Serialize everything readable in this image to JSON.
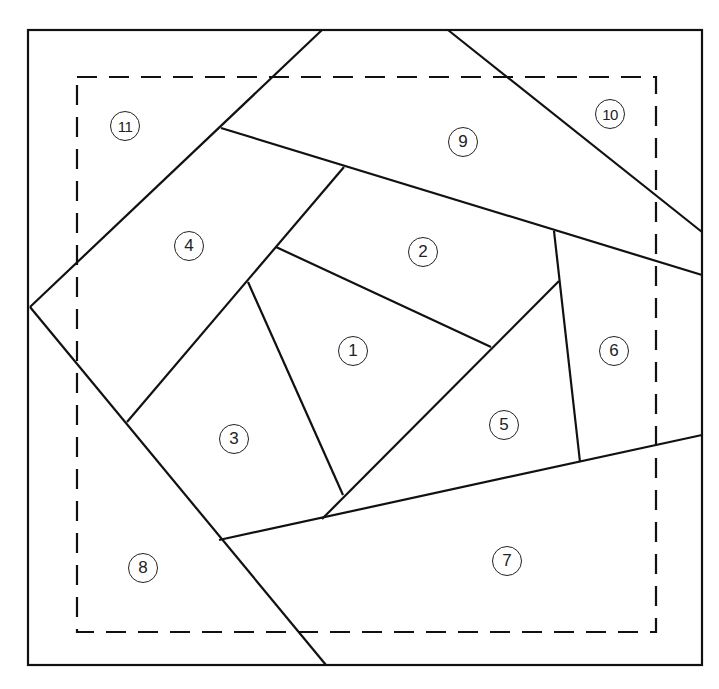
{
  "diagram": {
    "type": "foundation-piecing quilt block pattern",
    "outer_border": {
      "x1": 28,
      "y1": 30,
      "x2": 702,
      "y2": 665
    },
    "seam_allowance_dashed": {
      "x1": 77,
      "y1": 77,
      "x2": 656,
      "y2": 632
    },
    "seam_lines": [
      {
        "id": "A",
        "x1": 322,
        "y1": 30,
        "x2": 30,
        "y2": 307
      },
      {
        "id": "B",
        "x1": 30,
        "y1": 307,
        "x2": 326,
        "y2": 665
      },
      {
        "id": "C",
        "x1": 448,
        "y1": 30,
        "x2": 702,
        "y2": 232
      },
      {
        "id": "D",
        "x1": 221,
        "y1": 128,
        "x2": 702,
        "y2": 275
      },
      {
        "id": "E",
        "x1": 219,
        "y1": 540,
        "x2": 702,
        "y2": 435
      },
      {
        "id": "F",
        "x1": 344,
        "y1": 167,
        "x2": 127,
        "y2": 422
      },
      {
        "id": "G",
        "x1": 276,
        "y1": 247,
        "x2": 491,
        "y2": 347
      },
      {
        "id": "H",
        "x1": 248,
        "y1": 282,
        "x2": 343,
        "y2": 495
      },
      {
        "id": "I",
        "x1": 322,
        "y1": 519,
        "x2": 559,
        "y2": 281
      },
      {
        "id": "J",
        "x1": 554,
        "y1": 231,
        "x2": 580,
        "y2": 462
      }
    ],
    "pieces": [
      {
        "label": "1",
        "x": 353,
        "y": 351
      },
      {
        "label": "2",
        "x": 423,
        "y": 252
      },
      {
        "label": "3",
        "x": 234,
        "y": 439
      },
      {
        "label": "4",
        "x": 189,
        "y": 246
      },
      {
        "label": "5",
        "x": 504,
        "y": 425
      },
      {
        "label": "6",
        "x": 614,
        "y": 351
      },
      {
        "label": "7",
        "x": 507,
        "y": 561
      },
      {
        "label": "8",
        "x": 143,
        "y": 568
      },
      {
        "label": "9",
        "x": 463,
        "y": 142
      },
      {
        "label": "10",
        "x": 610,
        "y": 114
      },
      {
        "label": "11",
        "x": 125,
        "y": 126
      }
    ],
    "colors": {
      "line": "#111111",
      "background": "#ffffff"
    }
  }
}
